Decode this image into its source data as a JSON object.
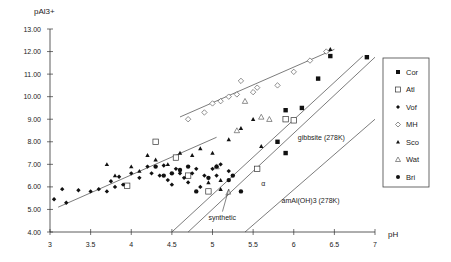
{
  "chart_data": {
    "type": "scatter",
    "title": "",
    "xlabel": "pH",
    "ylabel": "pAl3+",
    "xlim": [
      3,
      7
    ],
    "ylim": [
      4,
      13
    ],
    "x_ticks": [
      "3",
      "3.5",
      "4",
      "4.5",
      "5",
      "5.5",
      "6",
      "6.5",
      "7"
    ],
    "y_ticks": [
      "4.00",
      "5.00",
      "6.00",
      "7.00",
      "8.00",
      "9.00",
      "10.00",
      "11.00",
      "12.00",
      "13.00"
    ],
    "grid": false,
    "legend_position": "right",
    "series": [
      {
        "name": "Cor",
        "marker": "filled-square",
        "points": [
          [
            5.9,
            9.4
          ],
          [
            6.1,
            9.5
          ],
          [
            6.3,
            10.8
          ],
          [
            6.45,
            11.8
          ],
          [
            6.9,
            11.75
          ],
          [
            5.8,
            8.0
          ],
          [
            5.9,
            7.5
          ]
        ]
      },
      {
        "name": "Atl",
        "marker": "open-square",
        "points": [
          [
            3.95,
            6.05
          ],
          [
            4.3,
            8.0
          ],
          [
            4.95,
            5.8
          ],
          [
            5.55,
            6.8
          ],
          [
            5.9,
            9.0
          ],
          [
            6.0,
            8.95
          ],
          [
            4.55,
            7.3
          ],
          [
            4.7,
            6.5
          ]
        ]
      },
      {
        "name": "Vof",
        "marker": "filled-diamond",
        "points": [
          [
            3.05,
            5.45
          ],
          [
            3.15,
            5.9
          ],
          [
            3.2,
            5.3
          ],
          [
            3.35,
            5.85
          ],
          [
            3.5,
            5.8
          ],
          [
            3.6,
            5.9
          ],
          [
            3.7,
            5.8
          ],
          [
            3.75,
            6.25
          ],
          [
            3.8,
            6.0
          ],
          [
            3.85,
            6.45
          ],
          [
            3.9,
            6.1
          ],
          [
            4.0,
            6.6
          ],
          [
            4.1,
            6.4
          ],
          [
            4.2,
            6.9
          ],
          [
            4.25,
            6.6
          ],
          [
            4.35,
            6.5
          ],
          [
            4.4,
            6.95
          ],
          [
            4.45,
            6.3
          ],
          [
            4.5,
            6.1
          ],
          [
            4.55,
            6.8
          ],
          [
            4.6,
            6.6
          ],
          [
            4.65,
            6.4
          ],
          [
            4.7,
            6.2
          ],
          [
            4.75,
            6.6
          ],
          [
            4.8,
            6.8
          ],
          [
            4.9,
            6.5
          ],
          [
            5.0,
            6.8
          ],
          [
            5.05,
            6.5
          ],
          [
            5.1,
            7.0
          ],
          [
            5.2,
            6.7
          ],
          [
            4.85,
            6.0
          ]
        ]
      },
      {
        "name": "MH",
        "marker": "open-diamond",
        "points": [
          [
            4.7,
            9.0
          ],
          [
            4.9,
            9.3
          ],
          [
            5.0,
            9.7
          ],
          [
            5.1,
            9.8
          ],
          [
            5.2,
            10.0
          ],
          [
            5.3,
            10.1
          ],
          [
            5.35,
            10.7
          ],
          [
            5.5,
            10.2
          ],
          [
            5.55,
            10.4
          ],
          [
            5.8,
            10.5
          ],
          [
            6.0,
            11.1
          ],
          [
            6.2,
            11.6
          ],
          [
            6.4,
            12.0
          ]
        ]
      },
      {
        "name": "Sco",
        "marker": "filled-triangle",
        "points": [
          [
            3.7,
            7.0
          ],
          [
            3.8,
            6.5
          ],
          [
            4.0,
            6.9
          ],
          [
            4.1,
            6.7
          ],
          [
            4.2,
            7.4
          ],
          [
            4.3,
            7.2
          ],
          [
            4.45,
            7.0
          ],
          [
            4.6,
            7.5
          ],
          [
            4.75,
            7.4
          ],
          [
            4.85,
            7.7
          ],
          [
            5.0,
            7.5
          ],
          [
            5.1,
            6.3
          ],
          [
            5.2,
            8.1
          ],
          [
            5.35,
            8.6
          ],
          [
            5.5,
            9.0
          ],
          [
            5.6,
            7.8
          ],
          [
            6.45,
            12.1
          ],
          [
            4.95,
            6.2
          ],
          [
            5.1,
            5.9
          ]
        ]
      },
      {
        "name": "Wat",
        "marker": "open-triangle",
        "points": [
          [
            5.3,
            8.5
          ],
          [
            5.4,
            9.8
          ],
          [
            5.6,
            9.1
          ],
          [
            5.7,
            9.0
          ],
          [
            5.05,
            6.9
          ]
        ]
      },
      {
        "name": "Bri",
        "marker": "filled-circle",
        "points": [
          [
            4.3,
            6.9
          ],
          [
            4.4,
            6.5
          ],
          [
            4.5,
            6.6
          ],
          [
            4.6,
            6.75
          ],
          [
            4.7,
            6.9
          ],
          [
            4.8,
            5.8
          ],
          [
            4.95,
            6.4
          ],
          [
            5.05,
            6.9
          ],
          [
            5.2,
            6.3
          ],
          [
            5.25,
            6.5
          ],
          [
            5.35,
            5.8
          ]
        ]
      }
    ],
    "lines": [
      {
        "name": "regression-lower",
        "points": [
          [
            3.1,
            5.1
          ],
          [
            5.05,
            8.2
          ]
        ]
      },
      {
        "name": "regression-upper",
        "points": [
          [
            4.6,
            9.1
          ],
          [
            6.5,
            12.1
          ]
        ]
      },
      {
        "name": "gibbsite-synthetic",
        "points": [
          [
            4.5,
            4.0
          ],
          [
            6.85,
            11.8
          ]
        ]
      },
      {
        "name": "gibbsite (278K)",
        "points": [
          [
            4.7,
            4.0
          ],
          [
            7.0,
            11.75
          ]
        ]
      },
      {
        "name": "amAl(OH)3 (278K)",
        "points": [
          [
            5.4,
            4.0
          ],
          [
            7.0,
            9.0
          ]
        ]
      }
    ],
    "annotations": [
      {
        "text": "gibbsite (278K)",
        "x": 6.05,
        "y": 8.1
      },
      {
        "text": "synthetic",
        "x": 4.95,
        "y": 4.55,
        "arrow_to": [
          5.2,
          5.9
        ]
      },
      {
        "text": "amAl(OH)3 (278K)",
        "x": 5.85,
        "y": 5.3
      },
      {
        "text": "α",
        "x": 5.6,
        "y": 6.05
      }
    ]
  },
  "legend": {
    "items": [
      {
        "label": "Cor",
        "marker": "filled-square"
      },
      {
        "label": "Atl",
        "marker": "open-square"
      },
      {
        "label": "Vof",
        "marker": "filled-diamond"
      },
      {
        "label": "MH",
        "marker": "open-diamond"
      },
      {
        "label": "Sco",
        "marker": "filled-triangle"
      },
      {
        "label": "Wat",
        "marker": "open-triangle"
      },
      {
        "label": "Bri",
        "marker": "filled-circle"
      }
    ]
  },
  "axes": {
    "x_label": "pH",
    "y_label": "pAl3+"
  }
}
